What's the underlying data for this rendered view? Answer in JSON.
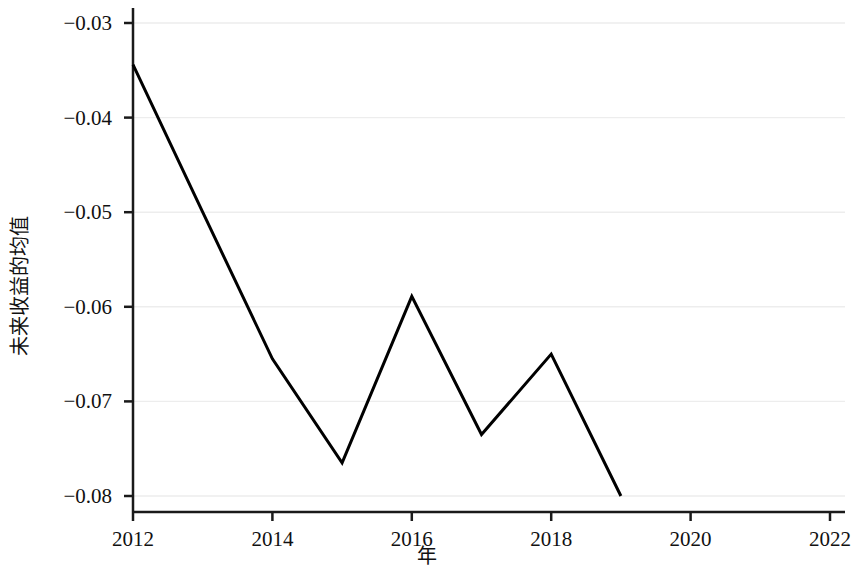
{
  "chart_data": {
    "type": "line",
    "title": "",
    "xlabel": "年",
    "ylabel": "未来收益的均值",
    "x": [
      2012,
      2013,
      2014,
      2015,
      2016,
      2017,
      2018,
      2019
    ],
    "values": [
      -0.0344,
      -0.05,
      -0.0655,
      -0.0765,
      -0.0589,
      -0.0735,
      -0.065,
      -0.08
    ],
    "series": [
      {
        "name": "未来收益的均值",
        "values": [
          -0.0344,
          -0.05,
          -0.0655,
          -0.0765,
          -0.0589,
          -0.0735,
          -0.065,
          -0.08
        ],
        "color": "#000000"
      }
    ],
    "xlim": [
      2012,
      2022
    ],
    "ylim": [
      -0.0815,
      -0.0275
    ],
    "xticks": [
      2012,
      2014,
      2016,
      2018,
      2020,
      2022
    ],
    "xtick_labels": [
      "2012",
      "2014",
      "2016",
      "2018",
      "2020",
      "2022"
    ],
    "yticks": [
      -0.03,
      -0.04,
      -0.05,
      -0.06,
      -0.07,
      -0.08
    ],
    "ytick_labels": [
      "−0.03",
      "−0.04",
      "−0.05",
      "−0.06",
      "−0.07",
      "−0.08"
    ],
    "grid": {
      "horizontal": true,
      "vertical": false,
      "color": "#ededed"
    },
    "legend": {
      "visible": false,
      "position": "none"
    },
    "background_color": "#ffffff",
    "axis_color": "#1a1a1a",
    "line_width": 3
  }
}
